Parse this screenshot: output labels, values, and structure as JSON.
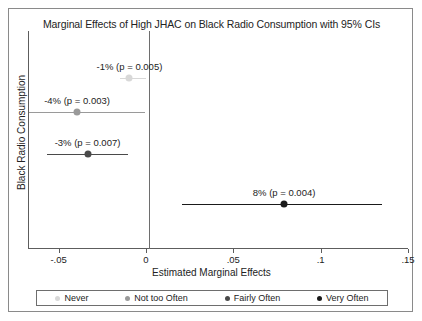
{
  "chart_data": {
    "type": "scatter",
    "title": "Marginal Effects of High JHAC on Black Radio Consumption with 95% CIs",
    "xlabel": "Estimated Marginal Effects",
    "ylabel": "Black Radio Consumption",
    "xlim": [
      -0.0675,
      0.15
    ],
    "xticks": [
      -0.05,
      0,
      0.05,
      0.1,
      0.15
    ],
    "xtick_labels": [
      "-.05",
      "0",
      ".05",
      ".1",
      ".15"
    ],
    "grid": false,
    "zero_reference_line": 0,
    "legend_position": "bottom",
    "series": [
      {
        "name": "Never",
        "label": "-1% (p = 0.005)",
        "estimate": -0.01,
        "p_value": 0.005,
        "ci_low": -0.0155,
        "ci_high": -0.0005,
        "color": "#d8d8d8"
      },
      {
        "name": "Not too Often",
        "label": "-4% (p = 0.003)",
        "estimate": -0.04,
        "p_value": 0.003,
        "ci_low": -0.0675,
        "ci_high": -0.0012,
        "color": "#9a9a9a"
      },
      {
        "name": "Fairly Often",
        "label": "-3% (p = 0.007)",
        "estimate": -0.034,
        "p_value": 0.007,
        "ci_low": -0.0571,
        "ci_high": -0.011,
        "color": "#4a4a4a"
      },
      {
        "name": "Very Often",
        "label": "8% (p = 0.004)",
        "estimate": 0.0785,
        "p_value": 0.004,
        "ci_low": 0.0202,
        "ci_high": 0.1345,
        "color": "#1a1a1a"
      }
    ]
  },
  "legend": {
    "items": [
      {
        "label": "Never",
        "color": "#d8d8d8"
      },
      {
        "label": "Not too Often",
        "color": "#9a9a9a"
      },
      {
        "label": "Fairly Often",
        "color": "#4a4a4a"
      },
      {
        "label": "Very Often",
        "color": "#1a1a1a"
      }
    ]
  }
}
